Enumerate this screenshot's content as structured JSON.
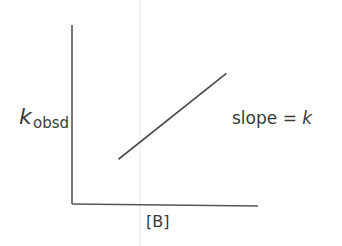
{
  "chart_data": {
    "type": "line",
    "title": "",
    "xlabel": "[B]",
    "ylabel_main": "k",
    "ylabel_sub": "obsd",
    "annotation": {
      "text": "slope = ",
      "italic": "k"
    },
    "series": [
      {
        "name": "kobsd vs [B]",
        "x": [
          0.25,
          0.83
        ],
        "y": [
          0.25,
          0.73
        ]
      }
    ],
    "xlim": [
      0,
      1
    ],
    "ylim": [
      0,
      1
    ],
    "grid": false,
    "ticks": false
  },
  "colors": {
    "axis": "#555555",
    "line": "#4a4a4a",
    "text": "#3a3a3a",
    "artifact": "#e6e6e6"
  }
}
